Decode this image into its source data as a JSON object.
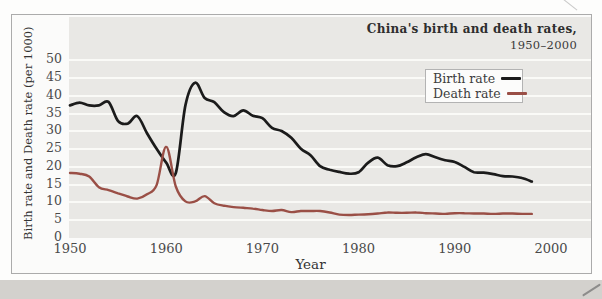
{
  "chart_data": {
    "type": "line",
    "title": "China's birth and death rates,",
    "subtitle": "1950–2000",
    "xlabel": "Year",
    "ylabel": "Birth rate and Death rate (per 1000)",
    "xlim": [
      1950,
      2000
    ],
    "ylim": [
      0,
      50
    ],
    "x_ticks": [
      1950,
      1960,
      1970,
      1980,
      1990,
      2000
    ],
    "y_ticks": [
      0,
      5,
      10,
      15,
      20,
      25,
      30,
      35,
      40,
      45,
      50
    ],
    "grid": "horizontal white gridlines on gray band",
    "legend_position": "upper-right-inside",
    "years_start": 1950,
    "years_end": 1998,
    "series": [
      {
        "name": "Birth rate",
        "color": "#1b1b1b",
        "values": [
          37.0,
          37.8,
          37.0,
          37.0,
          38.0,
          32.6,
          31.9,
          34.0,
          29.2,
          24.8,
          20.9,
          18.0,
          37.0,
          43.4,
          39.1,
          37.9,
          35.1,
          34.0,
          35.6,
          34.1,
          33.4,
          30.7,
          29.8,
          27.9,
          24.8,
          23.0,
          19.9,
          18.9,
          18.3,
          17.8,
          18.2,
          20.9,
          22.3,
          20.2,
          19.9,
          21.0,
          22.4,
          23.3,
          22.4,
          21.6,
          21.1,
          19.7,
          18.2,
          18.1,
          17.7,
          17.1,
          17.0,
          16.6,
          15.6
        ]
      },
      {
        "name": "Death rate",
        "color": "#9a4f46",
        "values": [
          18.0,
          17.8,
          17.0,
          14.0,
          13.2,
          12.3,
          11.4,
          10.8,
          12.0,
          14.6,
          25.4,
          14.2,
          10.0,
          10.0,
          11.5,
          9.5,
          8.8,
          8.4,
          8.2,
          8.0,
          7.6,
          7.3,
          7.6,
          7.0,
          7.3,
          7.3,
          7.3,
          6.9,
          6.3,
          6.2,
          6.3,
          6.4,
          6.6,
          6.9,
          6.8,
          6.8,
          6.9,
          6.7,
          6.6,
          6.5,
          6.7,
          6.7,
          6.6,
          6.6,
          6.5,
          6.6,
          6.6,
          6.5,
          6.5
        ]
      }
    ]
  },
  "style": {
    "plot_background": "#e9e8e5",
    "gridline_color": "#fafaf7",
    "card_border": "#ababab",
    "page_strip": "#d3d1cd",
    "tick_text": "#4a4a4a"
  }
}
